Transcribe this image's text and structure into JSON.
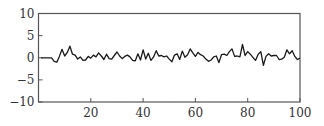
{
  "chart_data": {
    "type": "line",
    "title": "",
    "xlabel": "",
    "ylabel": "",
    "xlim": [
      0,
      100
    ],
    "ylim": [
      -10,
      10
    ],
    "grid": false,
    "legend": null,
    "x_ticks": [
      20,
      40,
      60,
      80,
      100
    ],
    "x_tick_labels": [
      "20",
      "40",
      "60",
      "80",
      "100"
    ],
    "y_ticks": [
      10,
      5,
      0,
      -5,
      -10
    ],
    "y_tick_labels": [
      "10",
      "5",
      "0",
      "−5",
      "−10"
    ],
    "series": [
      {
        "name": "signal",
        "color": "#1a1a1a",
        "x": [
          1,
          2,
          3,
          4,
          5,
          6,
          7,
          8,
          9,
          10,
          11,
          12,
          13,
          14,
          15,
          16,
          17,
          18,
          19,
          20,
          21,
          22,
          23,
          24,
          25,
          26,
          27,
          28,
          29,
          30,
          31,
          32,
          33,
          34,
          35,
          36,
          37,
          38,
          39,
          40,
          41,
          42,
          43,
          44,
          45,
          46,
          47,
          48,
          49,
          50,
          51,
          52,
          53,
          54,
          55,
          56,
          57,
          58,
          59,
          60,
          61,
          62,
          63,
          64,
          65,
          66,
          67,
          68,
          69,
          70,
          71,
          72,
          73,
          74,
          75,
          76,
          77,
          78,
          79,
          80,
          81,
          82,
          83,
          84,
          85,
          86,
          87,
          88,
          89,
          90,
          91,
          92,
          93,
          94,
          95,
          96,
          97,
          98,
          99,
          100
        ],
        "values": [
          0,
          0,
          0,
          0,
          0,
          -0.8,
          -1,
          0.3,
          1.9,
          0.4,
          1.2,
          2.6,
          0.8,
          0.6,
          -0.3,
          0.2,
          -0.6,
          -0.5,
          0.3,
          -0.1,
          0.6,
          0.2,
          1.1,
          0.4,
          -0.4,
          0.8,
          -0.2,
          -0.3,
          0.5,
          1.3,
          0.4,
          -0.2,
          0.3,
          0.6,
          0.2,
          -0.6,
          -0.7,
          0.9,
          -0.5,
          1.8,
          -0.3,
          1,
          -0.6,
          0.2,
          1.6,
          0.4,
          0.5,
          0.2,
          0.4,
          -0.3,
          -0.9,
          0.6,
          0.9,
          -0.4,
          1.5,
          0.1,
          0.7,
          2,
          1.1,
          0.3,
          1.2,
          0.7,
          0.4,
          -0.3,
          -0.8,
          -0.5,
          0.2,
          0.4,
          -1.1,
          0.7,
          0.8,
          0.5,
          1.4,
          2,
          0.3,
          0.4,
          0.2,
          3,
          0.5,
          1.4,
          0.8,
          0.1,
          -0.6,
          0.8,
          1.4,
          -1.7,
          0.3,
          0.9,
          0.4,
          0.5,
          0.5,
          -0.4,
          -0.3,
          0.1,
          1.8,
          0.9,
          1.6,
          0.3,
          -0.4,
          -0.1
        ]
      }
    ]
  }
}
